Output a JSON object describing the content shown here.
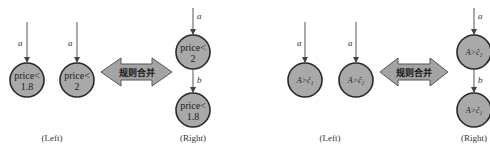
{
  "colors": {
    "node_fill": "#a9a9a9",
    "node_stroke": "#2a2a2a",
    "arrow_fill": "#a4a4a4",
    "background": "#ffffff"
  },
  "panels": [
    {
      "id": "price",
      "left": {
        "caption": "(Left)",
        "rules": [
          {
            "edge_label": "a",
            "node_lines": [
              "price<",
              "1.8"
            ]
          },
          {
            "edge_label": "a",
            "node_lines": [
              "price<",
              "2"
            ]
          }
        ]
      },
      "merge_arrow": {
        "label": "规则合并",
        "icon": "double-arrow-icon"
      },
      "right": {
        "caption": "(Right)",
        "chain": [
          {
            "edge_label": "a",
            "node_lines": [
              "price<",
              "2"
            ]
          },
          {
            "edge_label": "b",
            "node_lines": [
              "price<",
              "1.8"
            ]
          }
        ]
      }
    },
    {
      "id": "threshold",
      "left": {
        "caption": "(Left)",
        "rules": [
          {
            "edge_label": "a",
            "node_lines": [
              "A>ĉ₁"
            ]
          },
          {
            "edge_label": "a",
            "node_lines": [
              "A>ĉ₂"
            ]
          }
        ]
      },
      "merge_arrow": {
        "label": "规则合并",
        "icon": "double-arrow-icon"
      },
      "right": {
        "caption": "(Right)",
        "chain": [
          {
            "edge_label": "a",
            "node_lines": [
              "A>ĉ₂"
            ]
          },
          {
            "edge_label": "b",
            "node_lines": [
              "A>ĉ₁"
            ]
          }
        ]
      }
    }
  ]
}
